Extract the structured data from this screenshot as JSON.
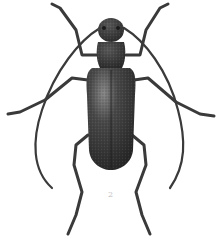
{
  "figure": {
    "label": "2",
    "colors": {
      "background": "#ffffff",
      "body_dark": "#2e2e2e",
      "body_mid": "#4a4a4a",
      "highlight": "#8a8a8a",
      "legs": "#3a3a3a",
      "label": "#bdbdbd"
    }
  }
}
